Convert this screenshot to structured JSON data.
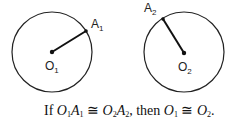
{
  "diagram": {
    "circle1": {
      "center_label": "O",
      "center_sub": "1",
      "point_label": "A",
      "point_sub": "1",
      "cx": 52,
      "cy": 52,
      "r": 40,
      "ax": 86,
      "ay": 31
    },
    "circle2": {
      "center_label": "O",
      "center_sub": "2",
      "point_label": "A",
      "point_sub": "2",
      "cx": 184,
      "cy": 52,
      "r": 40,
      "ax": 163,
      "ay": 19
    },
    "caption": {
      "if": "If ",
      "o": "O",
      "a": "A",
      "s1": "1",
      "s2": "2",
      "cong": " ≅ ",
      "comma_then": ", then ",
      "period": "."
    }
  }
}
